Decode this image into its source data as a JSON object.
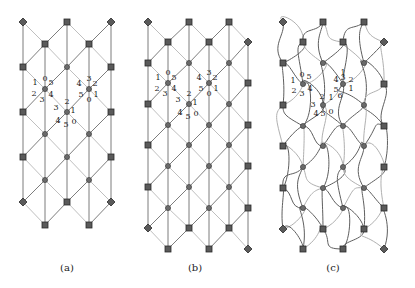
{
  "figure": {
    "panels": [
      {
        "id": "a",
        "caption": "(a)",
        "caption_pos": [
          67,
          271
        ],
        "style": "straight",
        "nodes": [
          {
            "x": 23,
            "y": 22,
            "s": "diamond"
          },
          {
            "x": 67,
            "y": 22,
            "s": "square"
          },
          {
            "x": 111,
            "y": 22,
            "s": "diamond"
          },
          {
            "x": 45,
            "y": 44,
            "s": "square"
          },
          {
            "x": 89,
            "y": 44,
            "s": "square"
          },
          {
            "x": 23,
            "y": 67,
            "s": "square"
          },
          {
            "x": 67,
            "y": 67,
            "s": "circle"
          },
          {
            "x": 111,
            "y": 67,
            "s": "square"
          },
          {
            "x": 45,
            "y": 89,
            "s": "circle"
          },
          {
            "x": 89,
            "y": 89,
            "s": "circle"
          },
          {
            "x": 23,
            "y": 112,
            "s": "square"
          },
          {
            "x": 67,
            "y": 112,
            "s": "circle"
          },
          {
            "x": 111,
            "y": 112,
            "s": "square"
          },
          {
            "x": 45,
            "y": 134,
            "s": "circle"
          },
          {
            "x": 89,
            "y": 134,
            "s": "circle"
          },
          {
            "x": 23,
            "y": 157,
            "s": "square"
          },
          {
            "x": 67,
            "y": 157,
            "s": "circle"
          },
          {
            "x": 111,
            "y": 157,
            "s": "square"
          },
          {
            "x": 45,
            "y": 180,
            "s": "circle"
          },
          {
            "x": 89,
            "y": 180,
            "s": "circle"
          },
          {
            "x": 23,
            "y": 202,
            "s": "diamond"
          },
          {
            "x": 67,
            "y": 202,
            "s": "square"
          },
          {
            "x": 111,
            "y": 202,
            "s": "diamond"
          },
          {
            "x": 45,
            "y": 225,
            "s": "square"
          },
          {
            "x": 89,
            "y": 225,
            "s": "square"
          }
        ],
        "labels": [
          {
            "cx": 45,
            "cy": 89,
            "items": [
              [
                "0",
                0,
                -11
              ],
              [
                "1",
                -10,
                -7
              ],
              [
                "5",
                6,
                -7
              ],
              [
                "2",
                -11,
                4
              ],
              [
                "3",
                -3,
                10
              ],
              [
                "4",
                6,
                5
              ]
            ]
          },
          {
            "cx": 89,
            "cy": 89,
            "items": [
              [
                "3",
                0,
                -11
              ],
              [
                "4",
                -10,
                -6
              ],
              [
                "2",
                6,
                -6
              ],
              [
                "5",
                -8,
                5
              ],
              [
                "0",
                0,
                10
              ],
              [
                "1",
                7,
                5
              ]
            ]
          },
          {
            "cx": 67,
            "cy": 112,
            "items": [
              [
                "2",
                0,
                -11
              ],
              [
                "3",
                -11,
                -5
              ],
              [
                "1",
                6,
                -2
              ],
              [
                "4",
                -9,
                8
              ],
              [
                "5",
                -1,
                12
              ],
              [
                "0",
                7,
                9
              ]
            ]
          }
        ]
      },
      {
        "id": "b",
        "caption": "(b)",
        "caption_pos": [
          195,
          271
        ],
        "style": "straight",
        "nodes": [
          {
            "x": 148,
            "y": 22,
            "s": "diamond"
          },
          {
            "x": 189,
            "y": 22,
            "s": "square"
          },
          {
            "x": 229,
            "y": 22,
            "s": "square"
          },
          {
            "x": 168,
            "y": 42,
            "s": "square"
          },
          {
            "x": 209,
            "y": 42,
            "s": "square"
          },
          {
            "x": 248,
            "y": 42,
            "s": "diamond"
          },
          {
            "x": 148,
            "y": 63,
            "s": "square"
          },
          {
            "x": 189,
            "y": 63,
            "s": "circle"
          },
          {
            "x": 229,
            "y": 63,
            "s": "circle"
          },
          {
            "x": 168,
            "y": 83,
            "s": "circle"
          },
          {
            "x": 209,
            "y": 83,
            "s": "circle"
          },
          {
            "x": 248,
            "y": 83,
            "s": "square"
          },
          {
            "x": 148,
            "y": 104,
            "s": "square"
          },
          {
            "x": 189,
            "y": 104,
            "s": "circle"
          },
          {
            "x": 229,
            "y": 104,
            "s": "circle"
          },
          {
            "x": 168,
            "y": 125,
            "s": "circle"
          },
          {
            "x": 209,
            "y": 125,
            "s": "circle"
          },
          {
            "x": 248,
            "y": 125,
            "s": "square"
          },
          {
            "x": 148,
            "y": 145,
            "s": "square"
          },
          {
            "x": 189,
            "y": 145,
            "s": "circle"
          },
          {
            "x": 229,
            "y": 145,
            "s": "circle"
          },
          {
            "x": 168,
            "y": 166,
            "s": "circle"
          },
          {
            "x": 209,
            "y": 166,
            "s": "circle"
          },
          {
            "x": 248,
            "y": 166,
            "s": "square"
          },
          {
            "x": 148,
            "y": 187,
            "s": "square"
          },
          {
            "x": 189,
            "y": 187,
            "s": "circle"
          },
          {
            "x": 229,
            "y": 187,
            "s": "circle"
          },
          {
            "x": 168,
            "y": 208,
            "s": "circle"
          },
          {
            "x": 209,
            "y": 208,
            "s": "circle"
          },
          {
            "x": 248,
            "y": 208,
            "s": "square"
          },
          {
            "x": 148,
            "y": 228,
            "s": "diamond"
          },
          {
            "x": 189,
            "y": 228,
            "s": "square"
          },
          {
            "x": 229,
            "y": 228,
            "s": "square"
          },
          {
            "x": 168,
            "y": 249,
            "s": "square"
          },
          {
            "x": 209,
            "y": 249,
            "s": "square"
          },
          {
            "x": 248,
            "y": 249,
            "s": "diamond"
          }
        ],
        "labels": [
          {
            "cx": 168,
            "cy": 83,
            "items": [
              [
                "0",
                0,
                -11
              ],
              [
                "1",
                -10,
                -6
              ],
              [
                "5",
                6,
                -6
              ],
              [
                "2",
                -11,
                5
              ],
              [
                "3",
                -3,
                10
              ],
              [
                "4",
                6,
                5
              ]
            ]
          },
          {
            "cx": 209,
            "cy": 83,
            "items": [
              [
                "3",
                0,
                -11
              ],
              [
                "4",
                -10,
                -6
              ],
              [
                "2",
                6,
                -6
              ],
              [
                "5",
                -8,
                5
              ],
              [
                "0",
                0,
                10
              ],
              [
                "1",
                7,
                5
              ]
            ]
          },
          {
            "cx": 189,
            "cy": 104,
            "items": [
              [
                "2",
                0,
                -11
              ],
              [
                "3",
                -11,
                -5
              ],
              [
                "1",
                6,
                -2
              ],
              [
                "4",
                -9,
                8
              ],
              [
                "5",
                -1,
                12
              ],
              [
                "0",
                7,
                9
              ]
            ]
          }
        ]
      },
      {
        "id": "c",
        "caption": "(c)",
        "caption_pos": [
          333,
          271
        ],
        "style": "tangled",
        "nodes": [
          {
            "x": 283,
            "y": 22,
            "s": "diamond"
          },
          {
            "x": 323,
            "y": 22,
            "s": "square"
          },
          {
            "x": 364,
            "y": 22,
            "s": "square"
          },
          {
            "x": 303,
            "y": 42,
            "s": "square"
          },
          {
            "x": 343,
            "y": 42,
            "s": "square"
          },
          {
            "x": 384,
            "y": 42,
            "s": "diamond"
          },
          {
            "x": 283,
            "y": 63,
            "s": "square"
          },
          {
            "x": 323,
            "y": 63,
            "s": "circle"
          },
          {
            "x": 364,
            "y": 63,
            "s": "circle"
          },
          {
            "x": 303,
            "y": 84,
            "s": "circle"
          },
          {
            "x": 343,
            "y": 84,
            "s": "circle"
          },
          {
            "x": 384,
            "y": 84,
            "s": "square"
          },
          {
            "x": 283,
            "y": 105,
            "s": "square"
          },
          {
            "x": 323,
            "y": 105,
            "s": "circle"
          },
          {
            "x": 364,
            "y": 105,
            "s": "circle"
          },
          {
            "x": 303,
            "y": 126,
            "s": "circle"
          },
          {
            "x": 343,
            "y": 126,
            "s": "circle"
          },
          {
            "x": 384,
            "y": 126,
            "s": "square"
          },
          {
            "x": 283,
            "y": 146,
            "s": "square"
          },
          {
            "x": 323,
            "y": 146,
            "s": "circle"
          },
          {
            "x": 364,
            "y": 146,
            "s": "circle"
          },
          {
            "x": 303,
            "y": 167,
            "s": "circle"
          },
          {
            "x": 343,
            "y": 167,
            "s": "circle"
          },
          {
            "x": 384,
            "y": 167,
            "s": "square"
          },
          {
            "x": 283,
            "y": 188,
            "s": "square"
          },
          {
            "x": 323,
            "y": 188,
            "s": "circle"
          },
          {
            "x": 364,
            "y": 188,
            "s": "circle"
          },
          {
            "x": 303,
            "y": 208,
            "s": "circle"
          },
          {
            "x": 343,
            "y": 208,
            "s": "circle"
          },
          {
            "x": 384,
            "y": 208,
            "s": "square"
          },
          {
            "x": 283,
            "y": 229,
            "s": "diamond"
          },
          {
            "x": 323,
            "y": 229,
            "s": "square"
          },
          {
            "x": 364,
            "y": 229,
            "s": "square"
          },
          {
            "x": 303,
            "y": 249,
            "s": "square"
          },
          {
            "x": 343,
            "y": 249,
            "s": "square"
          },
          {
            "x": 384,
            "y": 249,
            "s": "diamond"
          }
        ],
        "labels": [
          {
            "cx": 303,
            "cy": 84,
            "items": [
              [
                "0",
                -1,
                -10
              ],
              [
                "5",
                6,
                -8
              ],
              [
                "1",
                -10,
                -4
              ],
              [
                "4",
                7,
                4
              ],
              [
                "2",
                -9,
                6
              ],
              [
                "3",
                -1,
                9
              ]
            ]
          },
          {
            "cx": 343,
            "cy": 84,
            "items": [
              [
                "1",
                0,
                -12
              ],
              [
                "3",
                0,
                -7
              ],
              [
                "4",
                -7,
                -5
              ],
              [
                "2",
                8,
                -5
              ],
              [
                "5",
                -7,
                5
              ],
              [
                "1",
                8,
                4
              ],
              [
                "6",
                -3,
                11
              ]
            ]
          },
          {
            "cx": 323,
            "cy": 105,
            "items": [
              [
                "2",
                -1,
                -9
              ],
              [
                "1",
                8,
                -8
              ],
              [
                "3",
                -10,
                -1
              ],
              [
                "4",
                -7,
                8
              ],
              [
                "5",
                0,
                8
              ],
              [
                "0",
                8,
                6
              ]
            ]
          }
        ]
      }
    ]
  }
}
